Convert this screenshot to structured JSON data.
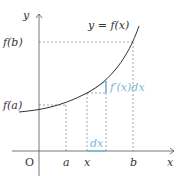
{
  "diagram": {
    "curve_label": "y = f(x)",
    "axes": {
      "x_label": "x",
      "y_label": "y",
      "origin_label": "O"
    },
    "x_ticks": [
      "a",
      "x",
      "b"
    ],
    "y_ticks": [
      "f(a)",
      "f(b)"
    ],
    "annotations": {
      "dx": "dx",
      "fprime_dx": "f′(x)dx"
    },
    "colors": {
      "axis": "#555555",
      "curve": "#333333",
      "dashed": "#666666",
      "highlight": "#7ab8d6"
    }
  }
}
